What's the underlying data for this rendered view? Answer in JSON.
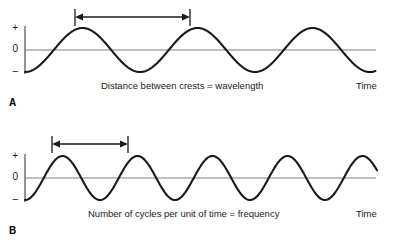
{
  "figure": {
    "background_color": "#ffffff",
    "wave_color": "#1a1a1a",
    "axis_color": "#808080",
    "annotation_color": "#1a1a1a"
  },
  "panels": [
    {
      "id": "A",
      "label": "A",
      "caption": "Distance between crests = wavelength",
      "x_axis_label": "Time",
      "y_tick_plus": "+",
      "y_tick_zero": "0",
      "y_tick_minus": "–",
      "measure_arrow_label": "crest-to-crest distance",
      "cycles": 3.05,
      "period_px": 115,
      "amplitude_px": 22,
      "baseline_y": 50,
      "arrow_y": 17,
      "arrow_x_start": 75,
      "arrow_x_end": 190
    },
    {
      "id": "B",
      "label": "B",
      "caption": "Number of cycles per unit of time = frequency",
      "x_axis_label": "Time",
      "y_tick_plus": "+",
      "y_tick_zero": "0",
      "y_tick_minus": "–",
      "measure_arrow_label": "one cycle duration",
      "cycles": 4.7,
      "period_px": 75,
      "amplitude_px": 22,
      "baseline_y": 54,
      "arrow_y": 20,
      "arrow_x_start": 52,
      "arrow_x_end": 128
    }
  ],
  "chart_data": {
    "type": "line",
    "xlabel": "Time",
    "ylabel": "",
    "ytick_labels": [
      "+",
      "0",
      "–"
    ],
    "grid": false,
    "legend": "none",
    "series": [
      {
        "name": "A – long wavelength wave",
        "waveform": "negative cosine",
        "cycles_shown": 3.05,
        "period_px": 115,
        "amplitude": 1,
        "annotation": "Distance between crests = wavelength"
      },
      {
        "name": "B – short wavelength (higher frequency) wave",
        "waveform": "negative cosine",
        "cycles_shown": 4.7,
        "period_px": 75,
        "amplitude": 1,
        "annotation": "Number of cycles per unit of time = frequency"
      }
    ]
  }
}
